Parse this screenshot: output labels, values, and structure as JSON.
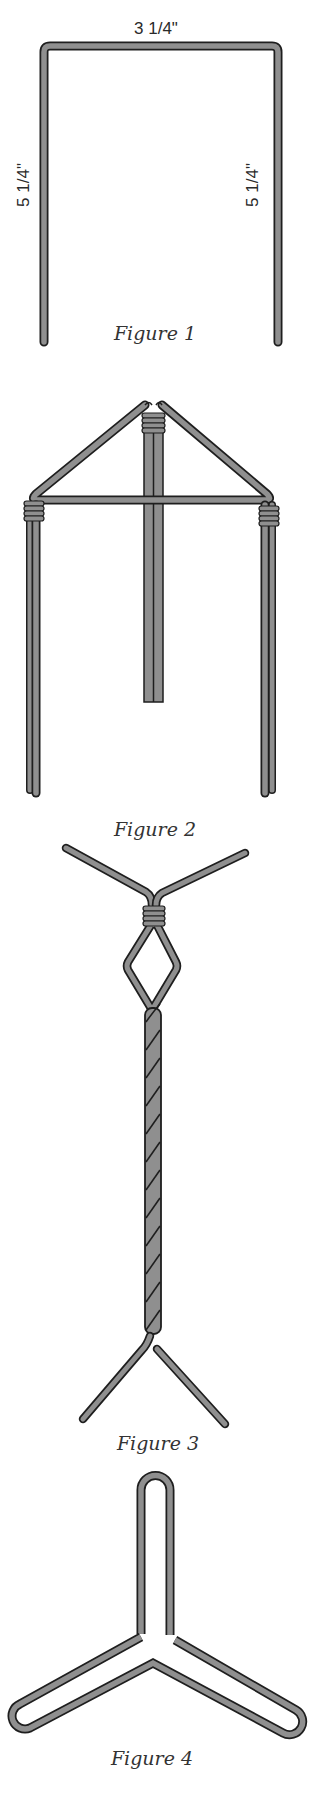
{
  "colors": {
    "wire_fill": "#8f8f8f",
    "wire_outline": "#1e1e1e",
    "background": "#ffffff",
    "text": "#2a2a2a"
  },
  "figure1": {
    "caption": "Figure 1",
    "top_dimension": "3 1/4\"",
    "left_dimension": "5 1/4\"",
    "right_dimension": "5 1/4\""
  },
  "figure2": {
    "caption": "Figure 2"
  },
  "figure3": {
    "caption": "Figure 3"
  },
  "figure4": {
    "caption": "Figure 4"
  }
}
